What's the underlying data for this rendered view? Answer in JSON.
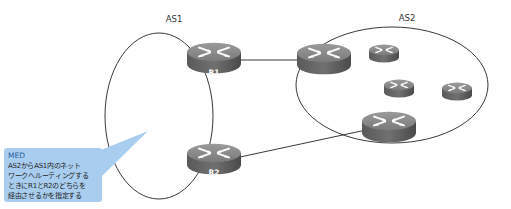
{
  "diagram": {
    "autonomous_systems": [
      {
        "id": "as1",
        "label": "AS1"
      },
      {
        "id": "as2",
        "label": "AS2"
      }
    ],
    "routers": [
      {
        "id": "r1",
        "label": "R1",
        "as": "as1",
        "icon": "router-icon"
      },
      {
        "id": "r2",
        "label": "R2",
        "as": "as1",
        "icon": "router-icon"
      },
      {
        "id": "as2-border-top",
        "label": "",
        "as": "as2",
        "icon": "router-icon"
      },
      {
        "id": "as2-border-bottom",
        "label": "",
        "as": "as2",
        "icon": "router-icon"
      },
      {
        "id": "as2-internal-1",
        "label": "",
        "as": "as2",
        "icon": "router-icon"
      },
      {
        "id": "as2-internal-2",
        "label": "",
        "as": "as2",
        "icon": "router-icon"
      },
      {
        "id": "as2-internal-3",
        "label": "",
        "as": "as2",
        "icon": "router-icon"
      }
    ],
    "links": [
      {
        "from": "r1",
        "to": "as2-border-top"
      },
      {
        "from": "r2",
        "to": "as2-border-bottom"
      }
    ],
    "callout": {
      "title": "MED",
      "lines": [
        "AS2からAS1内のネット",
        "ワークへルーティングする",
        "ときにR1とR2のどちらを",
        "経由させるかを指定する"
      ],
      "color": "#a9cdee",
      "title_color": "#2a5d9e"
    }
  }
}
